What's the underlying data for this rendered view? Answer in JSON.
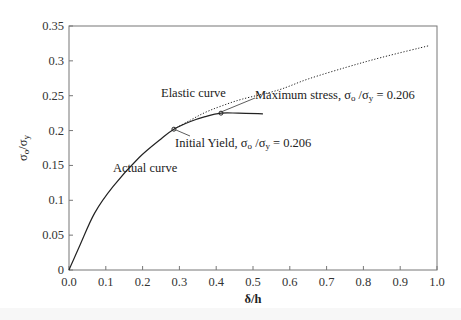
{
  "chart_data": {
    "type": "line",
    "title": "",
    "xlabel": "δ/h",
    "ylabel": "σo/σy",
    "xlim": [
      0.0,
      1.0
    ],
    "ylim": [
      0,
      0.35
    ],
    "x_ticks": [
      "0.0",
      "0.1",
      "0.2",
      "0.3",
      "0.4",
      "0.5",
      "0.6",
      "0.7",
      "0.8",
      "0.9",
      "1.0"
    ],
    "y_ticks": [
      "0",
      "0.05",
      "0.1",
      "0.15",
      "0.2",
      "0.25",
      "0.3",
      "0.35"
    ],
    "grid": false,
    "legend": null,
    "series": [
      {
        "name": "Actual curve",
        "style": "solid",
        "x": [
          0.0,
          0.03,
          0.07,
          0.12,
          0.19,
          0.25,
          0.285,
          0.33,
          0.37,
          0.413,
          0.46,
          0.527
        ],
        "y": [
          0.0,
          0.036,
          0.082,
          0.12,
          0.161,
          0.188,
          0.202,
          0.213,
          0.22,
          0.225,
          0.225,
          0.224
        ]
      },
      {
        "name": "Elastic curve",
        "style": "dotted",
        "x": [
          0.285,
          0.33,
          0.37,
          0.413,
          0.47,
          0.568,
          0.65,
          0.755,
          0.85,
          0.98
        ],
        "y": [
          0.202,
          0.215,
          0.226,
          0.235,
          0.245,
          0.258,
          0.274,
          0.291,
          0.305,
          0.322
        ]
      }
    ],
    "annotations": [
      {
        "text": "Actual curve",
        "x": 0.2,
        "y": 0.16
      },
      {
        "text": "Elastic curve",
        "x": 0.24,
        "y": 0.227
      },
      {
        "text": "Initial Yield, σo /σy = 0.206",
        "point": [
          0.285,
          0.202
        ]
      },
      {
        "text": "Maximum stress, σo /σy = 0.206",
        "point": [
          0.413,
          0.225
        ]
      }
    ]
  },
  "labels": {
    "xlabel": "δ/h",
    "ylabel_main": "σ",
    "ylabel_sub1": "o",
    "ylabel_slash": "/σ",
    "ylabel_sub2": "y",
    "actual_curve": "Actual curve",
    "elastic_curve": "Elastic curve",
    "initial_yield_prefix": "Initial Yield, σ",
    "initial_yield_sub1": "o",
    "initial_yield_mid": " /σ",
    "initial_yield_sub2": "y",
    "initial_yield_value": " = 0.206",
    "max_stress_prefix": "Maximum stress, σ",
    "max_stress_sub1": "o",
    "max_stress_mid": " /σ",
    "max_stress_sub2": "y",
    "max_stress_value": " = 0.206"
  }
}
